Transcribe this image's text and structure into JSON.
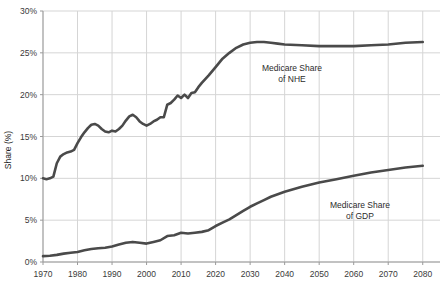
{
  "chart_data": {
    "type": "line",
    "title": "",
    "xlabel": "",
    "ylabel": "Share (%)",
    "xlim": [
      1970,
      2085
    ],
    "ylim": [
      0,
      30
    ],
    "grid": true,
    "legend_position": "inline-annotations",
    "x_ticks": [
      1970,
      1980,
      1990,
      2000,
      2010,
      2020,
      2030,
      2040,
      2050,
      2060,
      2070,
      2080
    ],
    "x_tick_labels": [
      "1970",
      "1980",
      "1990",
      "2000",
      "2010",
      "2020",
      "2030",
      "2040",
      "2050",
      "2060",
      "2070",
      "2080"
    ],
    "y_ticks": [
      0,
      5,
      10,
      15,
      20,
      25,
      30
    ],
    "y_tick_labels": [
      "0%",
      "5%",
      "10%",
      "15%",
      "20%",
      "25%",
      "30%"
    ],
    "line_color": "#4a4a4a",
    "grid_color": "#d5d5d5",
    "axis_color": "#9a9a9a",
    "series": [
      {
        "name": "Medicare Share of NHE",
        "annotation": [
          "Medicare Share",
          "of NHE"
        ],
        "x": [
          1970,
          1971,
          1972,
          1973,
          1974,
          1975,
          1976,
          1977,
          1978,
          1979,
          1980,
          1981,
          1982,
          1983,
          1984,
          1985,
          1986,
          1987,
          1988,
          1989,
          1990,
          1991,
          1992,
          1993,
          1994,
          1995,
          1996,
          1997,
          1998,
          1999,
          2000,
          2001,
          2002,
          2003,
          2004,
          2005,
          2006,
          2007,
          2008,
          2009,
          2010,
          2011,
          2012,
          2013,
          2014,
          2015,
          2016,
          2018,
          2020,
          2022,
          2024,
          2026,
          2028,
          2030,
          2032,
          2034,
          2036,
          2038,
          2040,
          2045,
          2050,
          2055,
          2060,
          2065,
          2070,
          2075,
          2080
        ],
        "y": [
          10.0,
          9.9,
          10.0,
          10.2,
          11.8,
          12.6,
          12.9,
          13.1,
          13.2,
          13.4,
          14.2,
          14.9,
          15.5,
          16.0,
          16.4,
          16.5,
          16.3,
          15.9,
          15.6,
          15.5,
          15.7,
          15.6,
          15.9,
          16.3,
          16.9,
          17.4,
          17.6,
          17.3,
          16.8,
          16.5,
          16.3,
          16.5,
          16.8,
          17.0,
          17.3,
          17.3,
          18.8,
          19.0,
          19.4,
          19.9,
          19.6,
          20.0,
          19.6,
          20.2,
          20.3,
          20.9,
          21.4,
          22.3,
          23.3,
          24.3,
          25.0,
          25.6,
          26.0,
          26.2,
          26.3,
          26.3,
          26.2,
          26.1,
          26.0,
          25.9,
          25.8,
          25.8,
          25.8,
          25.9,
          26.0,
          26.2,
          26.3
        ]
      },
      {
        "name": "Medicare Share of GDP",
        "annotation": [
          "Medicare Share",
          "of GDP"
        ],
        "x": [
          1970,
          1972,
          1974,
          1976,
          1978,
          1980,
          1982,
          1984,
          1986,
          1988,
          1990,
          1992,
          1994,
          1996,
          1998,
          2000,
          2002,
          2004,
          2006,
          2008,
          2010,
          2012,
          2014,
          2016,
          2018,
          2020,
          2022,
          2024,
          2026,
          2028,
          2030,
          2032,
          2034,
          2036,
          2038,
          2040,
          2045,
          2050,
          2055,
          2060,
          2065,
          2070,
          2075,
          2080
        ],
        "y": [
          0.7,
          0.75,
          0.85,
          1.0,
          1.1,
          1.2,
          1.4,
          1.55,
          1.65,
          1.7,
          1.85,
          2.1,
          2.3,
          2.4,
          2.3,
          2.2,
          2.4,
          2.6,
          3.1,
          3.2,
          3.5,
          3.4,
          3.5,
          3.6,
          3.8,
          4.3,
          4.7,
          5.1,
          5.6,
          6.1,
          6.6,
          7.0,
          7.4,
          7.8,
          8.1,
          8.4,
          9.0,
          9.5,
          9.9,
          10.3,
          10.7,
          11.0,
          11.3,
          11.5
        ]
      }
    ]
  }
}
